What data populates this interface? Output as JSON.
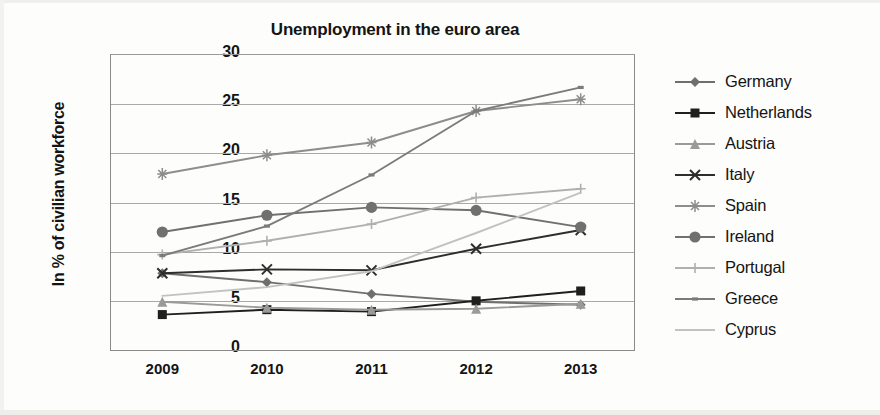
{
  "chart_data": {
    "type": "line",
    "title": "Unemployment in the euro area",
    "xlabel": "",
    "ylabel": "In % of civilian workforce",
    "categories": [
      "2009",
      "2010",
      "2011",
      "2012",
      "2013"
    ],
    "x": [
      2009,
      2010,
      2011,
      2012,
      2013
    ],
    "ylim": [
      0,
      30
    ],
    "yticks": [
      0,
      5,
      10,
      15,
      20,
      25,
      30
    ],
    "grid": true,
    "legend_position": "right",
    "series": [
      {
        "name": "Germany",
        "marker": "diamond",
        "color": "#6f6f6f",
        "values": [
          7.7,
          6.8,
          5.6,
          4.8,
          4.5
        ]
      },
      {
        "name": "Netherlands",
        "marker": "square",
        "color": "#1f1f1f",
        "values": [
          3.5,
          4.0,
          3.8,
          4.9,
          5.9
        ]
      },
      {
        "name": "Austria",
        "marker": "triangle",
        "color": "#9a9a9a",
        "values": [
          4.8,
          4.2,
          4.0,
          4.1,
          4.6
        ]
      },
      {
        "name": "Italy",
        "marker": "cross",
        "color": "#2e2e2e",
        "values": [
          7.7,
          8.1,
          8.0,
          10.2,
          12.1
        ]
      },
      {
        "name": "Spain",
        "marker": "asterisk",
        "color": "#8d8d8d",
        "values": [
          17.8,
          19.7,
          21.0,
          24.2,
          25.4
        ]
      },
      {
        "name": "Ireland",
        "marker": "circle",
        "color": "#707070",
        "values": [
          11.9,
          13.6,
          14.4,
          14.1,
          12.4
        ]
      },
      {
        "name": "Portugal",
        "marker": "plus",
        "color": "#b0b0b0",
        "values": [
          9.6,
          11.0,
          12.7,
          15.4,
          16.3
        ]
      },
      {
        "name": "Greece",
        "marker": "dash",
        "color": "#7b7b7b",
        "values": [
          9.5,
          12.5,
          17.7,
          24.2,
          26.6
        ]
      },
      {
        "name": "Cyprus",
        "marker": "none",
        "color": "#c2c2c2",
        "values": [
          5.4,
          6.3,
          7.9,
          11.8,
          15.9
        ]
      }
    ]
  },
  "legend": {
    "items": [
      {
        "label": "Germany"
      },
      {
        "label": "Netherlands"
      },
      {
        "label": "Austria"
      },
      {
        "label": "Italy"
      },
      {
        "label": "Spain"
      },
      {
        "label": "Ireland"
      },
      {
        "label": "Portugal"
      },
      {
        "label": "Greece"
      },
      {
        "label": "Cyprus"
      }
    ]
  }
}
